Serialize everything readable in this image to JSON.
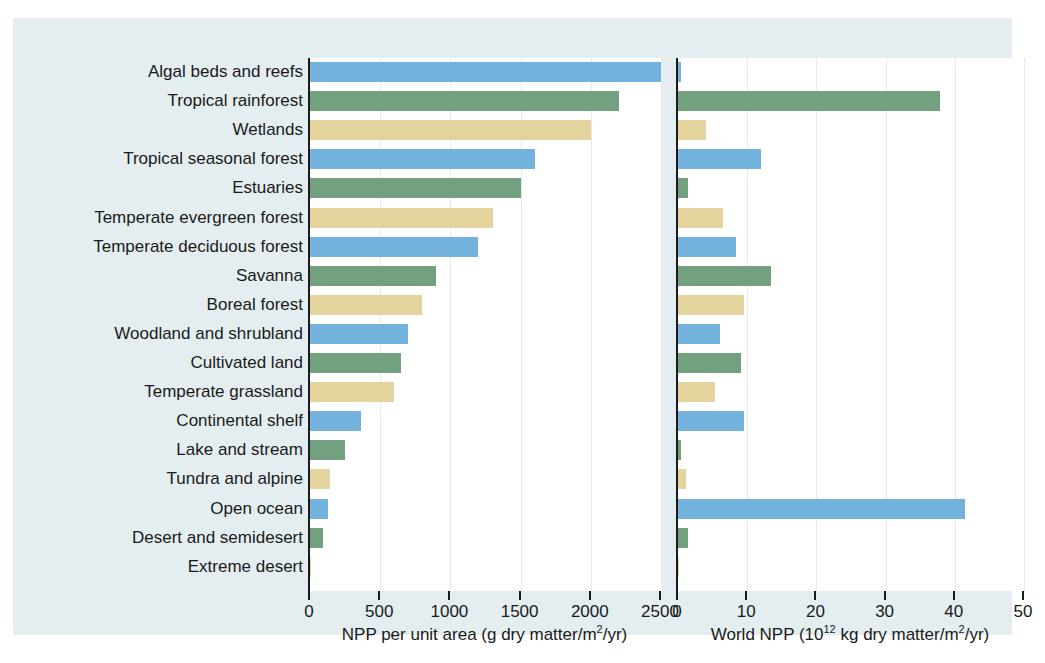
{
  "chart_data": {
    "type": "bar",
    "title": "",
    "orientation": "horizontal",
    "grid": true,
    "legend_position": "none",
    "categories": [
      "Algal beds and reefs",
      "Tropical rainforest",
      "Wetlands",
      "Tropical seasonal forest",
      "Estuaries",
      "Temperate evergreen forest",
      "Temperate deciduous forest",
      "Savanna",
      "Boreal forest",
      "Woodland and shrubland",
      "Cultivated land",
      "Temperate grassland",
      "Continental shelf",
      "Lake and stream",
      "Tundra and alpine",
      "Open ocean",
      "Desert and semidesert",
      "Extreme desert"
    ],
    "panels": [
      {
        "id": "npp-per-unit-area",
        "xlabel": "NPP per unit area (g dry matter/m²/yr)",
        "xlabel_parts": {
          "pre": "NPP per unit area (g dry matter/m",
          "sup": "2",
          "post": "/yr)"
        },
        "ylabel": "",
        "xlim": [
          0,
          2500
        ],
        "xticks": [
          0,
          500,
          1000,
          1500,
          2000,
          2500
        ],
        "xticklabels": [
          "0",
          "500",
          "1000",
          "1500",
          "2000",
          "2500"
        ],
        "values": [
          2500,
          2200,
          2000,
          1600,
          1500,
          1300,
          1200,
          900,
          800,
          700,
          650,
          600,
          360,
          250,
          140,
          125,
          90,
          3
        ]
      },
      {
        "id": "world-npp",
        "xlabel": "World NPP (10¹² kg dry matter/m²/yr)",
        "xlabel_parts": {
          "pre": "World NPP (10",
          "sup1": "12",
          "mid": " kg dry matter/m",
          "sup2": "2",
          "post": "/yr)"
        },
        "ylabel": "",
        "xlim": [
          0,
          50
        ],
        "xticks": [
          0,
          10,
          20,
          30,
          40,
          50
        ],
        "xticklabels": [
          "0",
          "10",
          "20",
          "30",
          "40",
          "50"
        ],
        "values": [
          0.5,
          37.8,
          4.0,
          12.0,
          1.4,
          6.5,
          8.4,
          13.5,
          9.6,
          6.0,
          9.1,
          5.4,
          9.6,
          0.4,
          1.1,
          41.5,
          1.5,
          0.04
        ]
      }
    ],
    "series_colors": [
      "#72b2dd",
      "#73a07f",
      "#e2d49c"
    ],
    "color_cycle_names": [
      "blue",
      "green",
      "tan"
    ]
  },
  "figure": {
    "background_color": "#e4eef1",
    "plot_background_color": "#ffffff",
    "axis_color": "#1a1a1a",
    "gridline_color": "#e9e9e9"
  }
}
